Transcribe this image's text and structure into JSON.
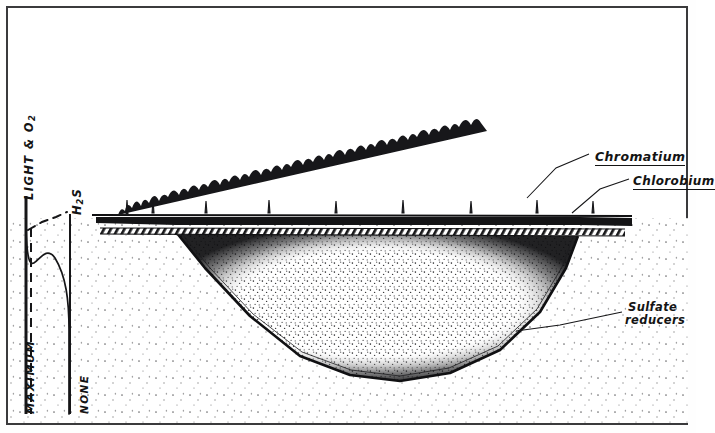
{
  "figure": {
    "type": "cross-section-diagram",
    "border_color": "#3a3a3c",
    "ink_color": "#141414",
    "background": "#ffffff"
  },
  "graph": {
    "axis_left_label": "MAXIMUM",
    "axis_right_label": "NONE",
    "curves": [
      {
        "name": "light-oxygen",
        "label": "LIGHT & O",
        "label_subscript": "2",
        "style": "dashed",
        "description": "Dashed profile high at surface then falling to none with depth"
      },
      {
        "name": "hydrogen-sulfide",
        "label": "H",
        "label_subscript": "2",
        "label_tail": "S",
        "style": "solid",
        "description": "Solid profile none at surface rising toward maximum with depth"
      }
    ]
  },
  "callouts": [
    {
      "id": "chromatium",
      "label": "Chromatium",
      "underlined": true,
      "target": "upper purple sulfur bacteria band"
    },
    {
      "id": "chlorobium",
      "label": "Chlorobium",
      "underlined": true,
      "target": "lower green sulfur bacteria band"
    },
    {
      "id": "sulfate-reducers",
      "line1": "Sulfate",
      "line2": "reducers",
      "underlined": false,
      "target": "anoxic lake bottom sediment"
    }
  ],
  "scene": {
    "surface_vegetation": "tree and shrub silhouette line along both shores",
    "water_surface": "horizontal shoreline across full width",
    "bands": [
      {
        "name": "chromatium-band",
        "fill": "solid dark",
        "position": "just below water surface"
      },
      {
        "name": "chlorobium-band",
        "fill": "diagonal hatching",
        "position": "directly beneath chromatium band"
      }
    ],
    "basin": "broad U-shaped lake basin with dense stippled water body and dark stippled rim",
    "sediment": "sparse regular stipple representing surrounding ground"
  }
}
